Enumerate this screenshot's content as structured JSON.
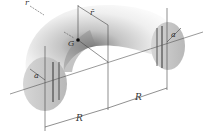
{
  "figure": {
    "labels": {
      "r_top": "r",
      "r_bar": "r̄",
      "G": "G",
      "a_left": "a",
      "a_right": "a",
      "R_left": "R",
      "R_right": "R"
    },
    "colors": {
      "body_light": "#f4f4f4",
      "body_shadow": "#9a9a9a",
      "section_fill": "#c8c8c8",
      "line": "#333333"
    }
  }
}
